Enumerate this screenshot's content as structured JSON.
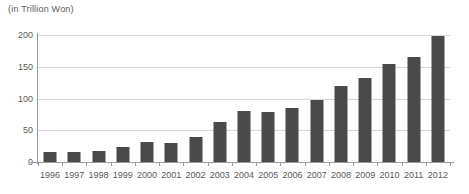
{
  "chart_data": {
    "type": "bar",
    "title": "",
    "unit_caption": "(in Trillion Won)",
    "xlabel": "",
    "ylabel": "",
    "ylim": [
      0,
      200
    ],
    "yticks": [
      0,
      50,
      100,
      150,
      200
    ],
    "ytick_labels": [
      "0",
      "50",
      "100",
      "150",
      "200"
    ],
    "grid": true,
    "legend": "none",
    "bar_color": "#4a4a4a",
    "gridline_color": "#d5d5d5",
    "axis_color": "#9a9a9a",
    "categories": [
      "1996",
      "1997",
      "1998",
      "1999",
      "2000",
      "2001",
      "2002",
      "2003",
      "2004",
      "2005",
      "2006",
      "2007",
      "2008",
      "2009",
      "2010",
      "2011",
      "2012"
    ],
    "values": [
      15,
      16,
      18,
      24,
      32,
      30,
      40,
      63,
      80,
      78,
      85,
      98,
      120,
      133,
      155,
      165,
      199
    ]
  }
}
